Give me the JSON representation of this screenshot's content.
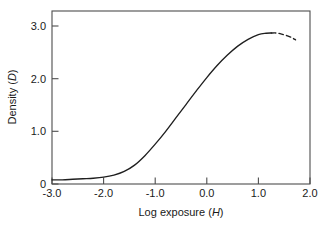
{
  "chart_data": {
    "type": "line",
    "title": "",
    "xlabel": "Log exposure (H)",
    "xlabel_plain": "Log exposure",
    "xlabel_symbol": "H",
    "ylabel": "Density (D)",
    "ylabel_plain": "Density",
    "ylabel_symbol": "D",
    "xlim": [
      -3.0,
      2.0
    ],
    "ylim": [
      0.0,
      3.3
    ],
    "grid": false,
    "legend": null,
    "xticks": [
      -3.0,
      -2.0,
      -1.0,
      0.0,
      1.0,
      2.0
    ],
    "xtick_labels": [
      "-3.0",
      "-2.0",
      "-1.0",
      "0.0",
      "1.0",
      "2.0"
    ],
    "yticks": [
      0.0,
      1.0,
      2.0,
      3.0
    ],
    "ytick_labels": [
      "0",
      "1.0",
      "2.0",
      "3.0"
    ],
    "tick_direction": "in",
    "line_color": "#1f1f1f",
    "frame_color": "#4d4d4d",
    "background_color": "#ffffff",
    "series": [
      {
        "name": "characteristic curve (solid)",
        "style": "solid",
        "x": [
          -3.0,
          -2.8,
          -2.6,
          -2.4,
          -2.2,
          -2.0,
          -1.8,
          -1.6,
          -1.4,
          -1.2,
          -1.0,
          -0.8,
          -0.6,
          -0.4,
          -0.2,
          0.0,
          0.2,
          0.4,
          0.6,
          0.8,
          1.0,
          1.15,
          1.25
        ],
        "y": [
          0.08,
          0.08,
          0.09,
          0.1,
          0.11,
          0.13,
          0.17,
          0.24,
          0.36,
          0.54,
          0.76,
          1.0,
          1.26,
          1.52,
          1.78,
          2.03,
          2.26,
          2.46,
          2.63,
          2.76,
          2.85,
          2.875,
          2.88
        ]
      },
      {
        "name": "reversal region (dashed)",
        "style": "dashed",
        "x": [
          1.25,
          1.35,
          1.45,
          1.55,
          1.65,
          1.72
        ],
        "y": [
          2.88,
          2.88,
          2.86,
          2.83,
          2.79,
          2.75
        ]
      }
    ],
    "annotations": [
      {
        "label": "base + fog density",
        "value": 0.08
      },
      {
        "label": "maximum density (Dmax)",
        "value": 2.88,
        "at_x": 1.3
      }
    ]
  }
}
